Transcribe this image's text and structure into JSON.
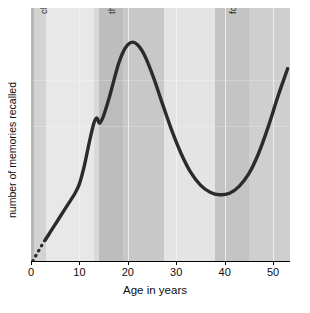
{
  "chart_data": {
    "type": "line",
    "title": "",
    "xlabel": "Age in years",
    "ylabel": "number of memories recalled",
    "xlim": [
      0,
      53.5
    ],
    "ylim": [
      0,
      1
    ],
    "xticks": [
      0,
      10,
      20,
      30,
      40,
      50
    ],
    "xticklabels": [
      "0",
      "10",
      "20",
      "30",
      "40",
      "50"
    ],
    "yticks": [],
    "yticklabels": [],
    "grid": "vertical-only",
    "legend": "none",
    "series": [
      {
        "name": "memories recalled",
        "style": "solid",
        "color": "#2b2b2b",
        "x": [
          3.0,
          4.0,
          5.0,
          6.0,
          7.0,
          8.0,
          9.0,
          10.0,
          11.0,
          12.0,
          13.0,
          13.6,
          14.2,
          15.0,
          16.0,
          17.0,
          18.0,
          19.0,
          20.0,
          21.0,
          22.0,
          23.0,
          24.0,
          25.5,
          27.0,
          29.0,
          31.0,
          33.0,
          35.0,
          37.0,
          39.0,
          41.0,
          43.0,
          45.0,
          47.0,
          49.0,
          51.0,
          53.0
        ],
        "y": [
          0.085,
          0.115,
          0.145,
          0.175,
          0.205,
          0.235,
          0.265,
          0.305,
          0.375,
          0.465,
          0.545,
          0.565,
          0.545,
          0.575,
          0.635,
          0.705,
          0.775,
          0.825,
          0.855,
          0.865,
          0.855,
          0.83,
          0.79,
          0.715,
          0.63,
          0.52,
          0.425,
          0.35,
          0.3,
          0.272,
          0.262,
          0.268,
          0.295,
          0.345,
          0.425,
          0.53,
          0.65,
          0.76
        ]
      },
      {
        "name": "childhood amnesia (extrapolated)",
        "style": "dotted",
        "color": "#2b2b2b",
        "x": [
          0.4,
          0.9,
          1.4,
          1.9,
          2.4,
          3.0
        ],
        "y": [
          0.0,
          0.018,
          0.035,
          0.05,
          0.068,
          0.085
        ]
      }
    ],
    "bands": [
      {
        "from": 0.0,
        "to": 0.6,
        "shade": "#b7b7b7"
      },
      {
        "from": 0.6,
        "to": 3.0,
        "shade": "#d3d3d3"
      },
      {
        "from": 3.0,
        "to": 13.0,
        "shade": "#e8e8e8"
      },
      {
        "from": 13.0,
        "to": 14.0,
        "shade": "#d9d9d9"
      },
      {
        "from": 14.0,
        "to": 19.0,
        "shade": "#bdbdbd"
      },
      {
        "from": 19.0,
        "to": 27.5,
        "shade": "#c8c8c8"
      },
      {
        "from": 27.5,
        "to": 38.0,
        "shade": "#e4e4e4"
      },
      {
        "from": 38.0,
        "to": 45.0,
        "shade": "#c4c4c4"
      },
      {
        "from": 45.0,
        "to": 53.5,
        "shade": "#cfcfcf"
      }
    ],
    "annotations": [
      {
        "text": "childhood amnesia (0–2)",
        "at_age": 1.6,
        "orientation": "vertical"
      },
      {
        "text": "the reminiscence bump",
        "at_age": 15.6,
        "orientation": "vertical"
      },
      {
        "text": "forgetting",
        "at_age": 40.6,
        "orientation": "vertical"
      }
    ]
  }
}
